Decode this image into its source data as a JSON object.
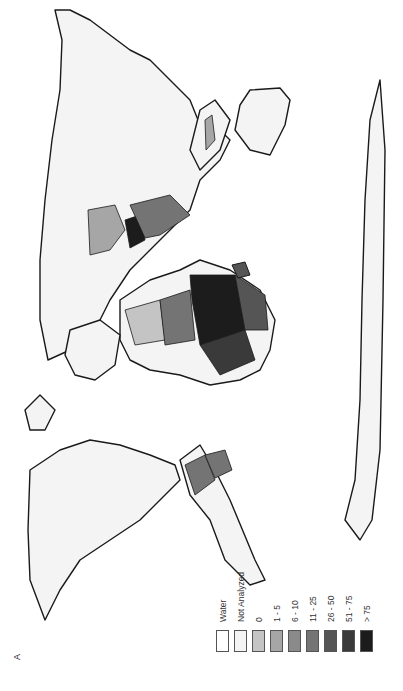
{
  "figure": {
    "panel_label": "A",
    "orientation": "rotated 90° counter-clockwise (north points left)",
    "map_type": "world choropleth"
  },
  "legend": {
    "items": [
      {
        "label": "Water",
        "color": "#ffffff"
      },
      {
        "label": "Not Analyzed",
        "color": "#f4f4f4"
      },
      {
        "label": "0",
        "color": "#c4c4c4"
      },
      {
        "label": "1 - 5",
        "color": "#a6a6a6"
      },
      {
        "label": "6 - 10",
        "color": "#8a8a8a"
      },
      {
        "label": "11 - 25",
        "color": "#747474"
      },
      {
        "label": "26 - 50",
        "color": "#555555"
      },
      {
        "label": "51 - 75",
        "color": "#3a3a3a"
      },
      {
        "label": "> 75",
        "color": "#1c1c1c"
      }
    ]
  },
  "regions": {
    "africa": {
      "shading": "mixed, heaviest in central/east Africa (>75)"
    },
    "south_america": {
      "shading": "northern countries 11-25, coastal 51-75"
    },
    "asia_middle_east": {
      "shading": "0 to 51-75 in south/central Asia"
    },
    "north_america": {
      "shading": "Not Analyzed"
    },
    "europe": {
      "shading": "Not Analyzed"
    },
    "australia": {
      "shading": "Not Analyzed"
    },
    "antarctica": {
      "shading": "Not Analyzed"
    }
  }
}
